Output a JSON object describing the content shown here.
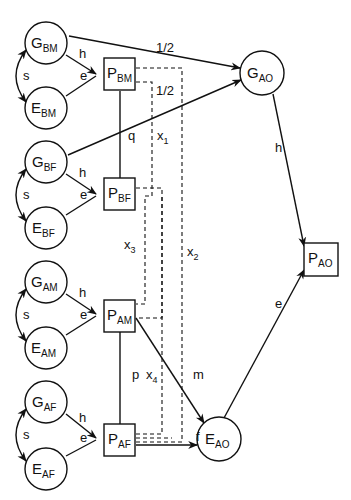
{
  "diagram": {
    "type": "path-diagram",
    "nodes": {
      "g_bm": {
        "main": "G",
        "sub": "BM"
      },
      "e_bm": {
        "main": "E",
        "sub": "BM"
      },
      "p_bm": {
        "main": "P",
        "sub": "BM"
      },
      "g_bf": {
        "main": "G",
        "sub": "BF"
      },
      "e_bf": {
        "main": "E",
        "sub": "BF"
      },
      "p_bf": {
        "main": "P",
        "sub": "BF"
      },
      "g_am": {
        "main": "G",
        "sub": "AM"
      },
      "e_am": {
        "main": "E",
        "sub": "AM"
      },
      "p_am": {
        "main": "P",
        "sub": "AM"
      },
      "g_af": {
        "main": "G",
        "sub": "AF"
      },
      "e_af": {
        "main": "E",
        "sub": "AF"
      },
      "p_af": {
        "main": "P",
        "sub": "AF"
      },
      "g_ao": {
        "main": "G",
        "sub": "AO"
      },
      "e_ao": {
        "main": "E",
        "sub": "AO"
      },
      "p_ao": {
        "main": "P",
        "sub": "AO"
      }
    },
    "labels": {
      "s": "s",
      "h": "h",
      "e": "e",
      "half": "1/2",
      "q": "q",
      "p": "p",
      "m": "m",
      "f": "f",
      "x1": "x",
      "x1_sub": "1",
      "x2": "x",
      "x2_sub": "2",
      "x3": "x",
      "x3_sub": "3",
      "x4": "x",
      "x4_sub": "4"
    }
  }
}
